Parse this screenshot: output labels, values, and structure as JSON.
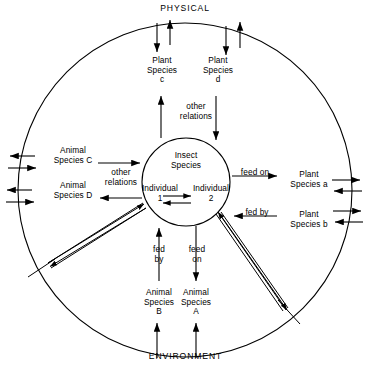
{
  "diagram": {
    "title_top": "PHYSICAL",
    "title_bottom": "ENVIRONMENT",
    "outer_boundary_name": "physical-environment-circle",
    "center": {
      "heading": "Insect\nSpecies",
      "individual_1": "Individual\n1",
      "individual_2": "Individual\n2"
    },
    "nodes": [
      {
        "id": "plant-c",
        "label": "Plant\nSpecies\nc"
      },
      {
        "id": "plant-d",
        "label": "Plant\nSpecies\nd"
      },
      {
        "id": "animal-c",
        "label": "Animal\nSpecies C"
      },
      {
        "id": "animal-d",
        "label": "Animal\nSpecies D"
      },
      {
        "id": "plant-a",
        "label": "Plant\nSpecies a"
      },
      {
        "id": "plant-b",
        "label": "Plant\nSpecies b"
      },
      {
        "id": "animal-b",
        "label": "Animal\nSpecies\nB"
      },
      {
        "id": "animal-a",
        "label": "Animal\nSpecies\nA"
      }
    ],
    "edge_labels": {
      "top_other_relations": "other\nrelations",
      "left_other_relations": "other\nrelations",
      "feed_on_right": "feed on",
      "fed_by_right": "fed by",
      "fed_by_bottom": "fed\nby",
      "feed_on_bottom": "feed\non"
    },
    "colors": {
      "ink": "#000000",
      "paper": "#ffffff"
    }
  }
}
